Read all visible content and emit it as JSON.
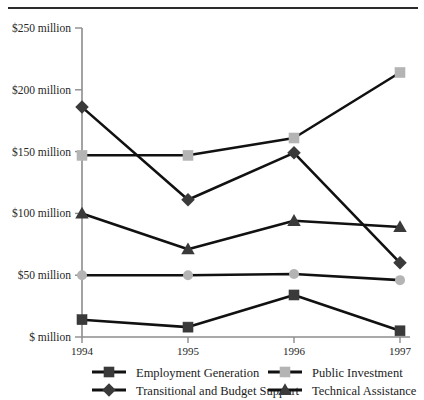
{
  "chart_data": {
    "type": "line",
    "title": "",
    "subtitle": "",
    "xlabel": "",
    "ylabel": "",
    "categories": [
      "1994",
      "1995",
      "1996",
      "1997"
    ],
    "x": [
      1994,
      1995,
      1996,
      1997
    ],
    "ylim": [
      0,
      250
    ],
    "ytick_values": [
      0,
      50,
      100,
      150,
      200,
      250
    ],
    "ytick_labels": [
      "$ million",
      "$50 million",
      "$100 million",
      "$150 million",
      "$200 million",
      "$250 million"
    ],
    "xtick_labels": [
      "1994",
      "1995",
      "1996",
      "1997"
    ],
    "grid": false,
    "legend_position": "bottom",
    "units": "million",
    "series": [
      {
        "name": "Employment Generation",
        "marker": "square",
        "color": "#3a3a3a",
        "line_color": "#111111",
        "values": [
          14,
          8,
          34,
          5
        ]
      },
      {
        "name": "Public Investment",
        "marker": "square",
        "color": "#b4b4b4",
        "line_color": "#111111",
        "values": [
          147,
          147,
          161,
          214
        ]
      },
      {
        "name": "Transitional and Budget Support",
        "marker": "diamond",
        "color": "#3a3a3a",
        "line_color": "#111111",
        "values": [
          186,
          111,
          149,
          60
        ]
      },
      {
        "name": "Technical Assistance",
        "marker": "triangle",
        "color": "#3a3a3a",
        "line_color": "#111111",
        "values": [
          100,
          71,
          94,
          89
        ]
      },
      {
        "name": "Unlabeled Baseline Series",
        "marker": "circle",
        "color": "#b4b4b4",
        "line_color": "#111111",
        "values": [
          50,
          50,
          51,
          46
        ]
      }
    ]
  },
  "legend": {
    "entries": [
      {
        "label": "Employment Generation",
        "marker": "square",
        "color": "#3a3a3a"
      },
      {
        "label": "Public Investment",
        "marker": "square",
        "color": "#b4b4b4"
      },
      {
        "label": "Transitional and Budget Support",
        "marker": "diamond",
        "color": "#3a3a3a"
      },
      {
        "label": "Technical Assistance",
        "marker": "triangle",
        "color": "#3a3a3a"
      }
    ]
  },
  "axis": {
    "line_color": "#8c8c8c",
    "tick_color": "#8c8c8c"
  }
}
